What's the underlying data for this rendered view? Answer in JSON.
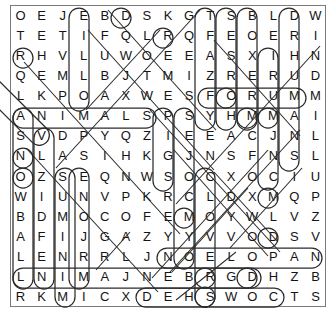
{
  "puzzle": {
    "type": "word-search",
    "rows": 15,
    "columns": 15,
    "grid": [
      [
        "O",
        "E",
        "J",
        "E",
        "B",
        "D",
        "S",
        "K",
        "G",
        "T",
        "S",
        "B",
        "L",
        "D",
        "W"
      ],
      [
        "T",
        "E",
        "T",
        "I",
        "F",
        "Q",
        "L",
        "R",
        "Q",
        "F",
        "E",
        "O",
        "E",
        "R",
        "I"
      ],
      [
        "R",
        "H",
        "V",
        "L",
        "U",
        "W",
        "O",
        "E",
        "E",
        "A",
        "S",
        "X",
        "I",
        "H",
        "N"
      ],
      [
        "Q",
        "E",
        "M",
        "L",
        "B",
        "J",
        "T",
        "M",
        "I",
        "Z",
        "R",
        "E",
        "R",
        "U",
        "D"
      ],
      [
        "L",
        "K",
        "P",
        "O",
        "A",
        "X",
        "W",
        "E",
        "S",
        "F",
        "O",
        "R",
        "U",
        "M",
        "M"
      ],
      [
        "A",
        "N",
        "I",
        "M",
        "A",
        "L",
        "S",
        "P",
        "S",
        "Y",
        "H",
        "M",
        "M",
        "A",
        "I"
      ],
      [
        "S",
        "V",
        "D",
        "P",
        "Y",
        "Q",
        "Z",
        "I",
        "E",
        "E",
        "A",
        "C",
        "J",
        "N",
        "L"
      ],
      [
        "N",
        "L",
        "A",
        "S",
        "I",
        "H",
        "K",
        "G",
        "J",
        "N",
        "S",
        "F",
        "N",
        "S",
        "L"
      ],
      [
        "O",
        "Z",
        "S",
        "E",
        "Q",
        "N",
        "W",
        "S",
        "O",
        "C",
        "X",
        "O",
        "C",
        "I",
        "U"
      ],
      [
        "W",
        "I",
        "U",
        "N",
        "V",
        "P",
        "K",
        "R",
        "C",
        "L",
        "D",
        "X",
        "M",
        "Q",
        "P"
      ],
      [
        "B",
        "D",
        "M",
        "O",
        "C",
        "O",
        "F",
        "E",
        "M",
        "O",
        "Y",
        "W",
        "L",
        "V",
        "Z"
      ],
      [
        "A",
        "F",
        "I",
        "J",
        "G",
        "A",
        "Z",
        "Y",
        "Y",
        "V",
        "V",
        "O",
        "D",
        "S",
        "V"
      ],
      [
        "L",
        "E",
        "N",
        "R",
        "R",
        "L",
        "J",
        "N",
        "O",
        "E",
        "L",
        "O",
        "P",
        "A",
        "N"
      ],
      [
        "L",
        "N",
        "I",
        "M",
        "A",
        "J",
        "N",
        "E",
        "B",
        "R",
        "G",
        "D",
        "H",
        "Z",
        "B"
      ],
      [
        "R",
        "K",
        "M",
        "I",
        "C",
        "X",
        "D",
        "E",
        "H",
        "S",
        "W",
        "O",
        "C",
        "T",
        "S"
      ]
    ],
    "found_words": [
      "ANIMALS",
      "SNOWBALL",
      "FORUM",
      "WINDMILL",
      "HUMANS",
      "PIGS",
      "NAPOLEON",
      "SQUEALER",
      "BOXER",
      "MOSES",
      "DOGS",
      "HORSE",
      "MILL",
      "WHEAT",
      "SHEEP"
    ],
    "colors": {
      "ink": "#141414",
      "ring": "#2b2b2b",
      "frame": "#7a7a7a",
      "background": "#ffffff"
    }
  }
}
